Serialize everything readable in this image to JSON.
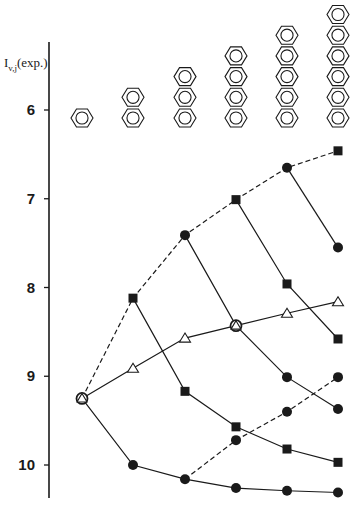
{
  "chart_data": {
    "type": "line",
    "title": "",
    "xlabel": "",
    "ylabel": "I_v,j (exp.)",
    "ylabel_main": "I",
    "ylabel_sub": "v,j",
    "ylabel_suffix": "(exp.)",
    "y_inverted": true,
    "ylim": [
      5.0,
      10.4
    ],
    "yticks": [
      6,
      7,
      8,
      9,
      10
    ],
    "grid": false,
    "legend": null,
    "categories": [
      "benzene",
      "naphthalene",
      "anthracene",
      "tetracene",
      "pentacene",
      "hexacene"
    ],
    "category_rings": [
      1,
      2,
      3,
      4,
      5,
      6
    ],
    "series": [
      {
        "name": "upper envelope (dashed)",
        "style": "dashed",
        "x": [
          0,
          1,
          2,
          3,
          4,
          5
        ],
        "values": [
          9.25,
          8.12,
          7.41,
          7.01,
          6.65,
          6.46
        ],
        "markers": [
          "circle-triangle",
          "square",
          "circle",
          "square",
          "circle",
          "square"
        ]
      },
      {
        "name": "square branch A",
        "style": "solid",
        "x": [
          1,
          2,
          3,
          4,
          5
        ],
        "values": [
          8.12,
          9.17,
          9.57,
          9.82,
          9.97
        ],
        "markers": [
          "square",
          "square",
          "square",
          "square",
          "square"
        ]
      },
      {
        "name": "circle branch A",
        "style": "solid",
        "x": [
          2,
          3,
          4,
          5
        ],
        "values": [
          7.41,
          8.43,
          9.01,
          9.37
        ],
        "markers": [
          "circle",
          "circle-triangle",
          "circle",
          "circle"
        ]
      },
      {
        "name": "square branch B",
        "style": "solid",
        "x": [
          3,
          4,
          5
        ],
        "values": [
          7.01,
          7.96,
          8.58
        ],
        "markers": [
          "square",
          "square",
          "square"
        ]
      },
      {
        "name": "circle branch B",
        "style": "solid",
        "x": [
          4,
          5
        ],
        "values": [
          6.65,
          7.55
        ],
        "markers": [
          "circle",
          "circle"
        ]
      },
      {
        "name": "lowest circle series",
        "style": "solid",
        "x": [
          0,
          1,
          2,
          3,
          4,
          5
        ],
        "values": [
          9.25,
          10.0,
          10.16,
          10.26,
          10.29,
          10.31
        ],
        "markers": [
          "circle-triangle",
          "circle",
          "circle",
          "circle",
          "circle",
          "circle"
        ]
      },
      {
        "name": "triangle series",
        "style": "solid",
        "x": [
          0,
          1,
          2,
          3,
          4,
          5
        ],
        "values": [
          9.25,
          8.91,
          8.57,
          8.43,
          8.29,
          8.16
        ],
        "markers": [
          "circle-triangle",
          "triangle",
          "triangle",
          "circle-triangle",
          "triangle",
          "triangle"
        ]
      },
      {
        "name": "lower dashed circle series",
        "style": "dashed",
        "x": [
          2,
          3,
          4,
          5
        ],
        "values": [
          10.16,
          9.72,
          9.4,
          9.01
        ],
        "markers": [
          "circle",
          "circle",
          "circle",
          "circle"
        ]
      }
    ]
  },
  "layout": {
    "x_positions": [
      82,
      133,
      185,
      236,
      287,
      338
    ],
    "y_axis_x": 49,
    "y_axis_top": 42,
    "y_axis_bottom": 498,
    "y_ref_value": 6,
    "y_ref_px": 110,
    "px_per_unit": 88.75,
    "ring_bottom_y": 118,
    "ring_spacing": 20.7,
    "ring_radius": 11,
    "colors": {
      "ink": "#1a1a1a",
      "background": "#ffffff"
    }
  }
}
